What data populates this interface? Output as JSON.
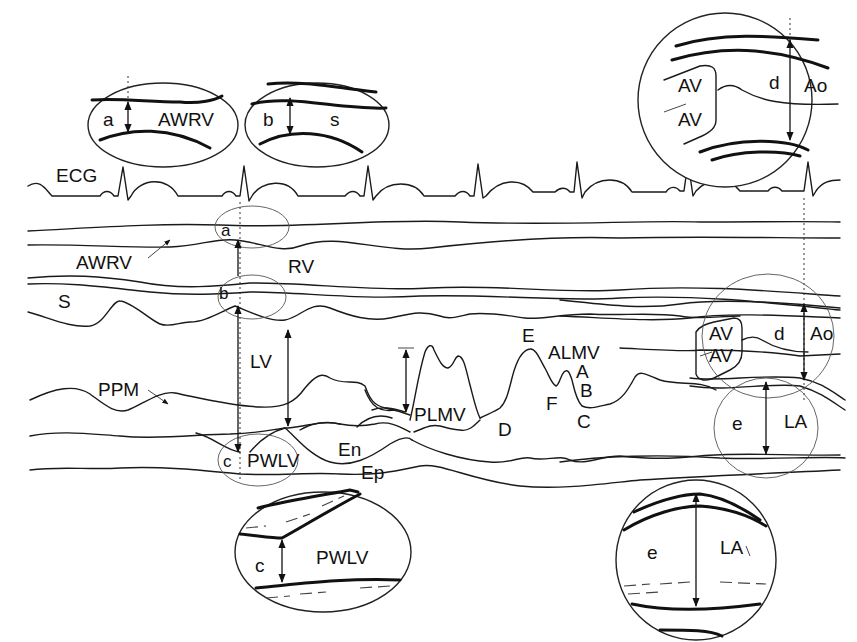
{
  "figure": {
    "colors": {
      "ink": "#111111",
      "background": "#ffffff"
    }
  },
  "labels": {
    "ecg": "ECG",
    "awrv": "AWRV",
    "rv": "RV",
    "s": "S",
    "lv": "LV",
    "ppm": "PPM",
    "pwlv": "PWLV",
    "en": "En",
    "ep": "Ep",
    "plmv": "PLMV",
    "almv": "ALMV",
    "d_point": "D",
    "e_point": "E",
    "f_point": "F",
    "a_point": "A",
    "b_point": "B",
    "c_point": "C",
    "av_top": "AV",
    "av_bottom": "AV",
    "ao": "Ao",
    "la": "LA",
    "meas_a": "a",
    "meas_b": "b",
    "meas_c": "c",
    "meas_d": "d",
    "meas_e": "e"
  },
  "insets": {
    "a": {
      "measure": "a",
      "label": "AWRV"
    },
    "b": {
      "measure": "b",
      "label": "s"
    },
    "c": {
      "measure": "c",
      "label": "PWLV"
    },
    "d": {
      "measure": "d",
      "label_valve_top": "AV",
      "label_valve_bottom": "AV",
      "label": "Ao"
    },
    "e": {
      "measure": "e",
      "label": "LA"
    }
  }
}
